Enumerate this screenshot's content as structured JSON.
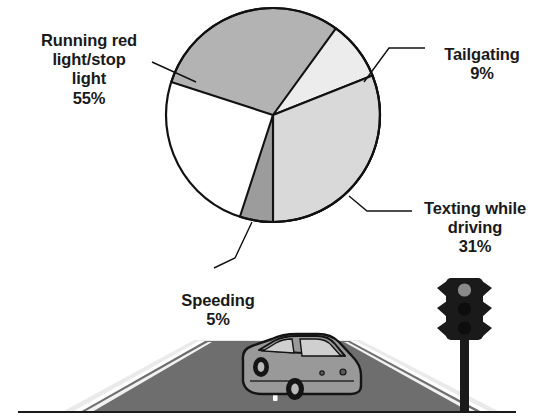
{
  "figure": {
    "background_color": "#ffffff",
    "outline_color": "#111111"
  },
  "chart_data": {
    "type": "pie",
    "title": "",
    "subtitle": "",
    "xlabel": "",
    "ylabel": "",
    "legend_position": "callout-labels",
    "grid": false,
    "categories": [
      "Running red light/stop light",
      "Tailgating",
      "Texting while driving",
      "Speeding"
    ],
    "values": [
      55,
      9,
      31,
      5
    ],
    "units": "percent",
    "total": 100,
    "slice_colors": [
      "#b3b3b3",
      "#ececec",
      "#d9d9d9",
      "#9c9c9c"
    ],
    "slices": [
      {
        "name": "Running red light/stop light",
        "value": 55,
        "value_label": "55%",
        "color": "#b3b3b3",
        "start_angle_deg": 198,
        "end_angle_deg": 396
      },
      {
        "name": "Tailgating",
        "value": 9,
        "value_label": "9%",
        "color": "#ececec",
        "start_angle_deg": 36,
        "end_angle_deg": 68.4
      },
      {
        "name": "Texting while driving",
        "value": 31,
        "value_label": "31%",
        "color": "#d9d9d9",
        "start_angle_deg": 68.4,
        "end_angle_deg": 180
      },
      {
        "name": "Speeding",
        "value": 5,
        "value_label": "5%",
        "color": "#9c9c9c",
        "start_angle_deg": 180,
        "end_angle_deg": 198
      }
    ]
  },
  "labels": {
    "running_red_light": {
      "text": "Running red\nlight/stop\nlight",
      "percent": "55%"
    },
    "tailgating": {
      "text": "Tailgating",
      "percent": "9%"
    },
    "texting_while_driving": {
      "text": "Texting while\ndriving",
      "percent": "31%"
    },
    "speeding": {
      "text": "Speeding",
      "percent": "5%"
    }
  },
  "illustration": {
    "name": "road-scene",
    "road_color": "#6e6e6e",
    "shoulder_color": "#e8e8e8",
    "lane_marking_color": "#ffffff",
    "car": {
      "body_color": "#999999",
      "window_color": "#cfcfcf",
      "wheel_color": "#1a1a1a"
    },
    "traffic_light": {
      "housing_color": "#1a1a1a",
      "lamps": [
        {
          "name": "red-lamp",
          "state": "on",
          "color": "#8a8a8a"
        },
        {
          "name": "yellow-lamp",
          "state": "off",
          "color": "#1a1a1a"
        },
        {
          "name": "green-lamp",
          "state": "off",
          "color": "#1a1a1a"
        }
      ],
      "pole_color": "#1a1a1a"
    },
    "ground_line_color": "#1a1a1a"
  }
}
